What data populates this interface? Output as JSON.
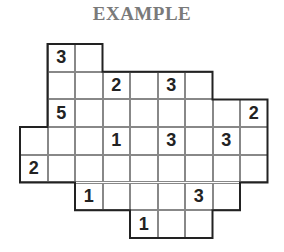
{
  "title": "EXAMPLE",
  "grid": {
    "cols": 9,
    "rows": 7,
    "row_spans": [
      [
        1,
        2
      ],
      [
        1,
        6
      ],
      [
        1,
        8
      ],
      [
        0,
        8
      ],
      [
        0,
        8
      ],
      [
        2,
        7
      ],
      [
        4,
        6
      ]
    ],
    "clues": [
      {
        "row": 0,
        "col": 1,
        "value": "3"
      },
      {
        "row": 1,
        "col": 3,
        "value": "2"
      },
      {
        "row": 1,
        "col": 5,
        "value": "3"
      },
      {
        "row": 2,
        "col": 1,
        "value": "5"
      },
      {
        "row": 2,
        "col": 8,
        "value": "2"
      },
      {
        "row": 3,
        "col": 3,
        "value": "1"
      },
      {
        "row": 3,
        "col": 5,
        "value": "3"
      },
      {
        "row": 3,
        "col": 7,
        "value": "3"
      },
      {
        "row": 4,
        "col": 0,
        "value": "2"
      },
      {
        "row": 5,
        "col": 2,
        "value": "1"
      },
      {
        "row": 5,
        "col": 6,
        "value": "3"
      },
      {
        "row": 6,
        "col": 4,
        "value": "1"
      }
    ]
  }
}
